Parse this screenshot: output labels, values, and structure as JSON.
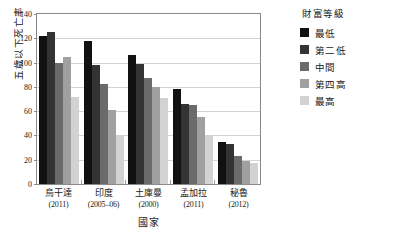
{
  "chart_data": {
    "type": "bar",
    "title": "",
    "xlabel": "國家",
    "ylabel": "五歲以下死亡率",
    "ylim": [
      0,
      140
    ],
    "yticks": [
      0,
      20,
      40,
      60,
      80,
      100,
      120,
      140
    ],
    "grid": true,
    "legend_position": "right",
    "legend_title": "財富等級",
    "categories": [
      {
        "name": "烏干達",
        "year": "(2011)"
      },
      {
        "name": "印度",
        "year": "(2005–06)"
      },
      {
        "name": "土庫曼",
        "year": "(2000)"
      },
      {
        "name": "孟加拉",
        "year": "(2011)"
      },
      {
        "name": "秘魯",
        "year": "(2012)"
      }
    ],
    "series": [
      {
        "name": "最低",
        "color": "#111111",
        "values": [
          122,
          118,
          106,
          78,
          35
        ]
      },
      {
        "name": "第二低",
        "color": "#333333",
        "values": [
          125,
          98,
          99,
          66,
          33
        ]
      },
      {
        "name": "中間",
        "color": "#6b6b6b",
        "values": [
          100,
          82,
          87,
          65,
          23
        ]
      },
      {
        "name": "第四高",
        "color": "#a0a0a0",
        "values": [
          105,
          61,
          80,
          55,
          19
        ]
      },
      {
        "name": "最高",
        "color": "#d2d2d2",
        "values": [
          72,
          40,
          71,
          40,
          17
        ]
      }
    ]
  }
}
